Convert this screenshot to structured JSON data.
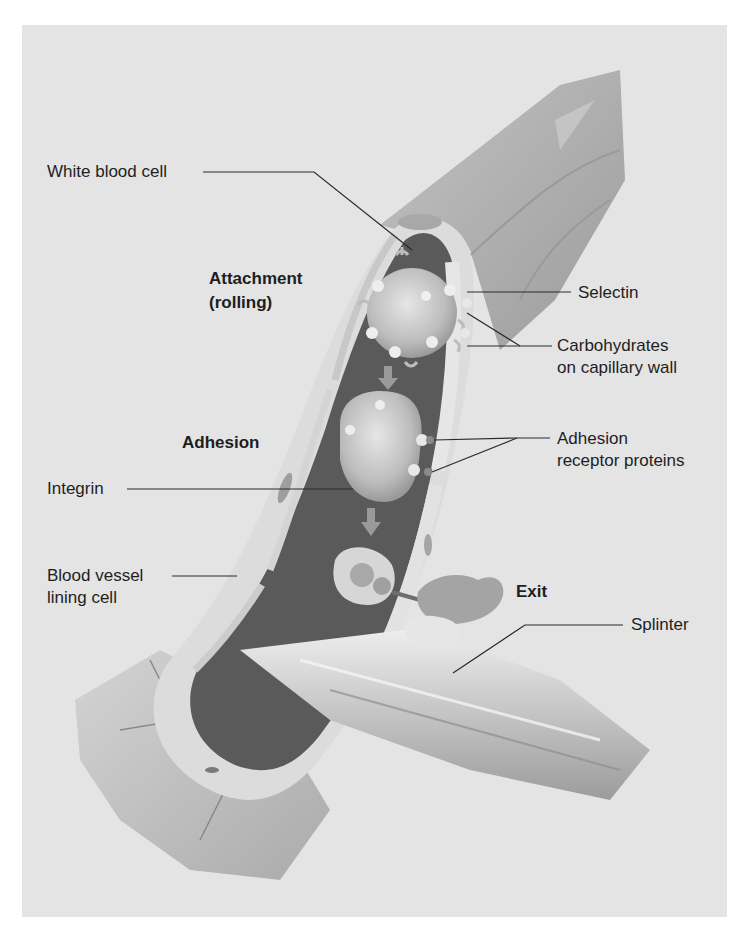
{
  "diagram": {
    "colors": {
      "panel_bg": "#e4e4e4",
      "page_bg": "#ffffff",
      "label_text": "#1e1e1e",
      "vessel_outer": "#a9a9a9",
      "vessel_lumen": "#5a5a5a",
      "vessel_wall": "#dcdcdc",
      "cell_fill": "#c8c8c8"
    },
    "stage_labels": {
      "attachment_line1": "Attachment",
      "attachment_line2": "(rolling)",
      "adhesion": "Adhesion",
      "exit": "Exit"
    },
    "callouts": {
      "white_blood_cell": "White blood cell",
      "selectin": "Selectin",
      "carbohydrates_line1": "Carbohydrates",
      "carbohydrates_line2": "on capillary wall",
      "adhesion_receptor_line1": "Adhesion",
      "adhesion_receptor_line2": "receptor proteins",
      "integrin": "Integrin",
      "blood_vessel_line1": "Blood vessel",
      "blood_vessel_line2": "lining cell",
      "splinter": "Splinter"
    }
  }
}
